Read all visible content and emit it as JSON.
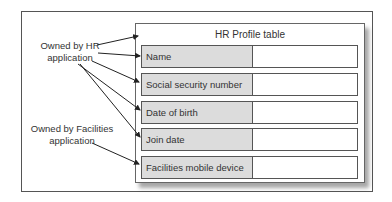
{
  "diagram": {
    "table_title": "HR Profile table",
    "rows": [
      {
        "label": "Name",
        "value": ""
      },
      {
        "label": "Social security number",
        "value": ""
      },
      {
        "label": "Date of birth",
        "value": ""
      },
      {
        "label": "Join date",
        "value": ""
      },
      {
        "label": "Facilities mobile device",
        "value": ""
      }
    ],
    "annotations": [
      {
        "line1": "Owned by HR",
        "line2": "application",
        "points_to": [
          "HR Profile table",
          "Name",
          "Social security number",
          "Date of birth",
          "Join date"
        ]
      },
      {
        "line1": "Owned by Facilities",
        "line2": "application",
        "points_to": [
          "Facilities mobile device"
        ]
      }
    ],
    "colors": {
      "label_fill": "#dcdcdc",
      "border": "#555555"
    }
  }
}
